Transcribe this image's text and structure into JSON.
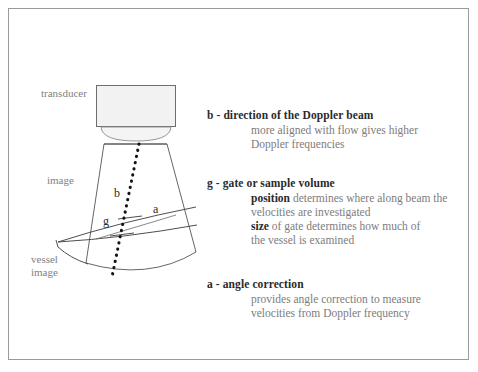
{
  "figure": {
    "colors": {
      "frame": "#9a9a9a",
      "line": "#3a3a3a",
      "label_gray": "#807f7f",
      "heading_dark": "#2a2a2a",
      "transducer_fill": "#f0f0f0",
      "page_background": "#ffffff"
    }
  },
  "diagram": {
    "labels": {
      "transducer": "transducer",
      "image": "image",
      "vessel_image": "vessel\nimage"
    },
    "markers": {
      "beam": "b",
      "gate": "g",
      "angle": "a"
    }
  },
  "legend": {
    "blocks": [
      {
        "heading": "b - direction of the Doppler beam",
        "lines": [
          {
            "emphasis": "",
            "text": "more aligned with flow gives higher"
          },
          {
            "emphasis": "",
            "text": "Doppler frequencies"
          }
        ]
      },
      {
        "heading": "g - gate or sample volume",
        "lines": [
          {
            "emphasis": "position",
            "text": " determines where along beam the"
          },
          {
            "emphasis": "",
            "text": "velocities are investigated"
          },
          {
            "emphasis": "size",
            "text": " of gate determines how much of"
          },
          {
            "emphasis": "",
            "text": "the vessel is examined"
          }
        ]
      },
      {
        "heading": "a - angle correction",
        "lines": [
          {
            "emphasis": "",
            "text": "provides angle correction to measure"
          },
          {
            "emphasis": "",
            "text": "velocities from Doppler frequency"
          }
        ]
      }
    ]
  }
}
